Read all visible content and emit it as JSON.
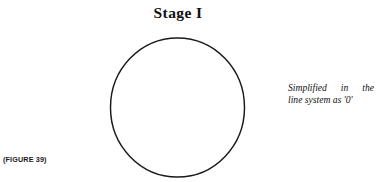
{
  "page": {
    "background_color": "#ffffff",
    "ink_color": "#1a1a1a",
    "width": 383,
    "height": 182
  },
  "title": {
    "text": "Stage I"
  },
  "figure": {
    "shape_name": "circle",
    "stroke_color": "#1a1a1a",
    "fill": "none"
  },
  "annotation": {
    "line1": "Simplified in the",
    "line2": "line system as '0'"
  },
  "caption": {
    "text": "(FIGURE 39)"
  }
}
